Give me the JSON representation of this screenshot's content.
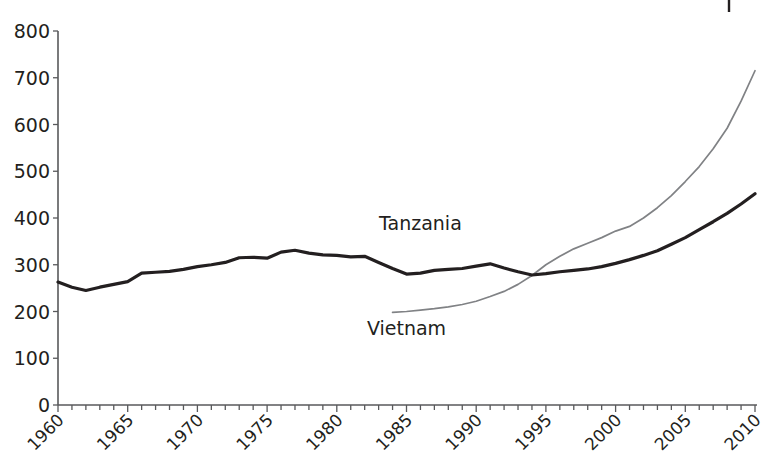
{
  "chart_data": {
    "type": "line",
    "title": "",
    "subtitle": "",
    "xlabel": "",
    "ylabel": "",
    "xlim": [
      1960,
      2010
    ],
    "ylim": [
      0,
      800
    ],
    "grid": false,
    "legend_position": "inline-annotation",
    "y_ticks": [
      0,
      100,
      200,
      300,
      400,
      500,
      600,
      700,
      800
    ],
    "y_tick_labels": [
      "0",
      "100",
      "200",
      "300",
      "400",
      "500",
      "600",
      "700",
      "800"
    ],
    "x_ticks": [
      1960,
      1965,
      1970,
      1975,
      1980,
      1985,
      1990,
      1995,
      2000,
      2005,
      2010
    ],
    "x_tick_labels": [
      "1960",
      "1965",
      "1970",
      "1975",
      "1980",
      "1985",
      "1990",
      "1995",
      "2000",
      "2005",
      "2010"
    ],
    "x_minor_tick_step": 1,
    "annotations": [
      {
        "name": "tanzania-label",
        "text": "Tanzania",
        "x": 1986,
        "y": 375
      },
      {
        "name": "vietnam-label",
        "text": "Vietnam",
        "x": 1985,
        "y": 150
      }
    ],
    "series": [
      {
        "name": "Tanzania",
        "color": "#231f20",
        "style": "thick-solid",
        "x": [
          1960,
          1961,
          1962,
          1963,
          1964,
          1965,
          1966,
          1967,
          1968,
          1969,
          1970,
          1971,
          1972,
          1973,
          1974,
          1975,
          1976,
          1977,
          1978,
          1979,
          1980,
          1981,
          1982,
          1983,
          1984,
          1985,
          1986,
          1987,
          1988,
          1989,
          1990,
          1991,
          1992,
          1993,
          1994,
          1995,
          1996,
          1997,
          1998,
          1999,
          2000,
          2001,
          2002,
          2003,
          2004,
          2005,
          2006,
          2007,
          2008,
          2009,
          2010
        ],
        "values": [
          263,
          252,
          245,
          252,
          258,
          264,
          282,
          284,
          286,
          290,
          296,
          300,
          305,
          315,
          316,
          314,
          327,
          331,
          325,
          321,
          320,
          317,
          318,
          305,
          292,
          280,
          282,
          288,
          290,
          292,
          297,
          302,
          293,
          285,
          278,
          281,
          285,
          288,
          291,
          296,
          303,
          311,
          320,
          330,
          344,
          358,
          375,
          392,
          410,
          430,
          452
        ]
      },
      {
        "name": "Vietnam",
        "color": "#808285",
        "style": "thin-solid",
        "x": [
          1984,
          1985,
          1986,
          1987,
          1988,
          1989,
          1990,
          1991,
          1992,
          1993,
          1994,
          1995,
          1996,
          1997,
          1998,
          1999,
          2000,
          2001,
          2002,
          2003,
          2004,
          2005,
          2006,
          2007,
          2008,
          2009,
          2010
        ],
        "values": [
          198,
          200,
          203,
          206,
          210,
          215,
          222,
          232,
          243,
          258,
          277,
          300,
          318,
          334,
          346,
          358,
          372,
          382,
          400,
          422,
          448,
          478,
          510,
          548,
          592,
          650,
          715
        ]
      }
    ]
  },
  "axes": {
    "y_axis_name": "value-axis",
    "x_axis_name": "year-axis"
  }
}
